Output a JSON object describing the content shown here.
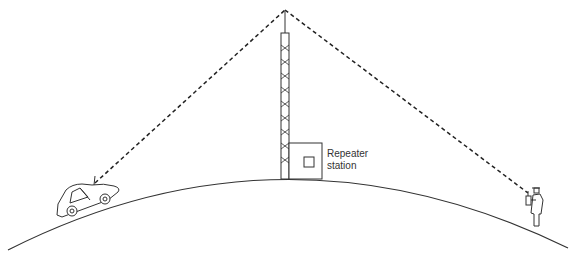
{
  "diagram": {
    "labels": {
      "repeater_line1": "Repeater",
      "repeater_line2": "station"
    },
    "elements": [
      {
        "name": "earth-surface-arc",
        "type": "curve"
      },
      {
        "name": "repeater-tower",
        "type": "lattice tower with antenna"
      },
      {
        "name": "repeater-station-building",
        "type": "box"
      },
      {
        "name": "car-with-antenna",
        "type": "vehicle"
      },
      {
        "name": "person-with-handheld-radio",
        "type": "figure"
      },
      {
        "name": "signal-path-car-to-tower",
        "type": "dashed line"
      },
      {
        "name": "signal-path-tower-to-person",
        "type": "dashed line"
      }
    ],
    "colors": {
      "line": "#333333",
      "background": "#ffffff"
    }
  }
}
